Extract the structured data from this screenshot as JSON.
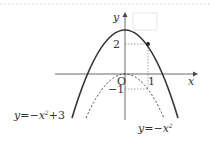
{
  "diagram": {
    "axes": {
      "x_label": "x",
      "y_label": "y",
      "origin_label": "O"
    },
    "ticks": {
      "x": [
        "1"
      ],
      "y": [
        "2",
        "−1"
      ]
    },
    "curves": [
      {
        "name": "solid-parabola",
        "equation": "y=−x²+3",
        "label_main": "y=−x",
        "label_sup": "2",
        "label_tail": "+3",
        "style": "solid"
      },
      {
        "name": "dotted-parabola",
        "equation": "y=−x²",
        "label_main": "y=−x",
        "label_sup": "2",
        "style": "dotted"
      }
    ],
    "points": [
      {
        "x": 1,
        "y": 2
      },
      {
        "x": 1,
        "y": -1
      }
    ]
  }
}
